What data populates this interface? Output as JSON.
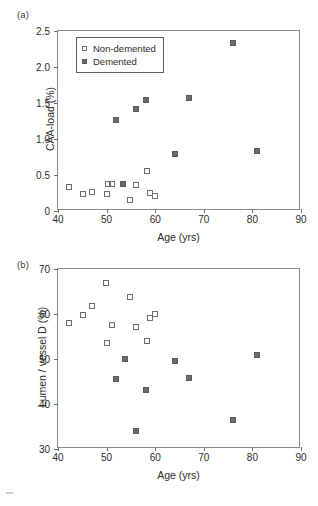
{
  "figure": {
    "panel_a_tag": "(a)",
    "panel_b_tag": "(b)"
  },
  "legend": {
    "position": "top-left-inside",
    "items": [
      {
        "label": "Non-demented",
        "marker": "open-square",
        "color": "#ffffff"
      },
      {
        "label": "Demented",
        "marker": "filled-square",
        "color": "#6b6b6b"
      }
    ]
  },
  "chart_data": [
    {
      "type": "scatter",
      "panel": "(a)",
      "title": "",
      "xlabel": "Age (yrs)",
      "ylabel": "CAA-load (%)",
      "xlim": [
        40,
        90
      ],
      "ylim": [
        0,
        2.5
      ],
      "xticks": [
        40,
        50,
        60,
        70,
        80,
        90
      ],
      "yticks": [
        0,
        0.5,
        1.0,
        1.5,
        2.0,
        2.5
      ],
      "xticklabels": [
        "40",
        "50",
        "60",
        "70",
        "80",
        "90"
      ],
      "yticklabels": [
        "0",
        "0.5",
        "1.0",
        "1.5",
        "2.0",
        "2.5"
      ],
      "grid": false,
      "legend_position": "upper left",
      "series": [
        {
          "name": "Non-demented",
          "marker": "open-square",
          "points": [
            {
              "x": 42.3,
              "y": 0.34
            },
            {
              "x": 45.2,
              "y": 0.24
            },
            {
              "x": 46.9,
              "y": 0.27
            },
            {
              "x": 50.0,
              "y": 0.23
            },
            {
              "x": 50.3,
              "y": 0.38
            },
            {
              "x": 51.2,
              "y": 0.37
            },
            {
              "x": 54.8,
              "y": 0.15
            },
            {
              "x": 56.1,
              "y": 0.36
            },
            {
              "x": 58.3,
              "y": 0.56
            },
            {
              "x": 58.9,
              "y": 0.25
            },
            {
              "x": 59.9,
              "y": 0.21
            }
          ]
        },
        {
          "name": "Demented",
          "marker": "filled-square",
          "points": [
            {
              "x": 52.0,
              "y": 1.26
            },
            {
              "x": 53.3,
              "y": 0.37
            },
            {
              "x": 56.1,
              "y": 1.42
            },
            {
              "x": 58.1,
              "y": 1.54
            },
            {
              "x": 64.1,
              "y": 0.79
            },
            {
              "x": 67.0,
              "y": 1.57
            },
            {
              "x": 76.1,
              "y": 2.33
            },
            {
              "x": 81.0,
              "y": 0.84
            }
          ]
        }
      ]
    },
    {
      "type": "scatter",
      "panel": "(b)",
      "title": "",
      "xlabel": "Age (yrs)",
      "ylabel": "Lumen / vessel D (%)",
      "xlim": [
        40,
        90
      ],
      "ylim": [
        30,
        70
      ],
      "xticks": [
        40,
        50,
        60,
        70,
        80,
        90
      ],
      "yticks": [
        30,
        40,
        50,
        60,
        70
      ],
      "xticklabels": [
        "40",
        "50",
        "60",
        "70",
        "80",
        "90"
      ],
      "yticklabels": [
        "30",
        "40",
        "50",
        "60",
        "70"
      ],
      "grid": false,
      "legend_position": "none",
      "series": [
        {
          "name": "Non-demented",
          "marker": "open-square",
          "points": [
            {
              "x": 42.3,
              "y": 58.0
            },
            {
              "x": 45.2,
              "y": 59.7
            },
            {
              "x": 46.9,
              "y": 61.7
            },
            {
              "x": 49.9,
              "y": 67.0
            },
            {
              "x": 50.0,
              "y": 53.6
            },
            {
              "x": 51.2,
              "y": 57.6
            },
            {
              "x": 54.8,
              "y": 63.8
            },
            {
              "x": 56.1,
              "y": 57.1
            },
            {
              "x": 58.3,
              "y": 54.0
            },
            {
              "x": 58.9,
              "y": 59.1
            },
            {
              "x": 59.9,
              "y": 60.0
            }
          ]
        },
        {
          "name": "Demented",
          "marker": "filled-square",
          "points": [
            {
              "x": 52.0,
              "y": 45.6
            },
            {
              "x": 53.8,
              "y": 50.1
            },
            {
              "x": 56.0,
              "y": 33.9
            },
            {
              "x": 58.1,
              "y": 43.1
            },
            {
              "x": 64.1,
              "y": 49.6
            },
            {
              "x": 67.0,
              "y": 45.8
            },
            {
              "x": 76.1,
              "y": 36.4
            },
            {
              "x": 81.0,
              "y": 50.9
            }
          ]
        }
      ]
    }
  ]
}
